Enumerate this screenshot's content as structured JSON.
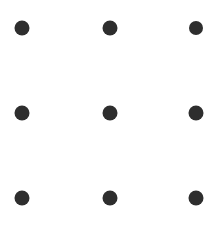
{
  "canvas": {
    "width": 219,
    "height": 227,
    "background_color": "#ffffff",
    "title": "Dot Grid"
  },
  "grid": {
    "rows": 3,
    "columns": 3,
    "dot_color": "#2e2e2e",
    "dot_diameter": 15,
    "column_centers_px": [
      22,
      110,
      196
    ],
    "row_centers_px": [
      28,
      113,
      198
    ],
    "dots": [
      {
        "id": "dot-r1-c1",
        "row": 1,
        "col": 1,
        "cx": 22,
        "cy": 28,
        "d": 15,
        "color": "#2e2e2e"
      },
      {
        "id": "dot-r1-c2",
        "row": 1,
        "col": 2,
        "cx": 110,
        "cy": 28,
        "d": 15,
        "color": "#2e2e2e"
      },
      {
        "id": "dot-r1-c3",
        "row": 1,
        "col": 3,
        "cx": 196,
        "cy": 28,
        "d": 14,
        "color": "#2e2e2e"
      },
      {
        "id": "dot-r2-c1",
        "row": 2,
        "col": 1,
        "cx": 22,
        "cy": 113,
        "d": 15,
        "color": "#2e2e2e"
      },
      {
        "id": "dot-r2-c2",
        "row": 2,
        "col": 2,
        "cx": 110,
        "cy": 113,
        "d": 15,
        "color": "#2e2e2e"
      },
      {
        "id": "dot-r2-c3",
        "row": 2,
        "col": 3,
        "cx": 196,
        "cy": 113,
        "d": 15,
        "color": "#2e2e2e"
      },
      {
        "id": "dot-r3-c1",
        "row": 3,
        "col": 1,
        "cx": 22,
        "cy": 198,
        "d": 15,
        "color": "#2e2e2e"
      },
      {
        "id": "dot-r3-c2",
        "row": 3,
        "col": 2,
        "cx": 110,
        "cy": 198,
        "d": 15,
        "color": "#2e2e2e"
      },
      {
        "id": "dot-r3-c3",
        "row": 3,
        "col": 3,
        "cx": 196,
        "cy": 198,
        "d": 15,
        "color": "#2e2e2e"
      }
    ]
  }
}
